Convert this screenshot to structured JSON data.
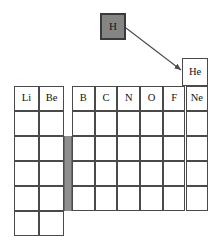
{
  "figure": {
    "type": "periodic-table-fragment",
    "background_color": "#ffffff",
    "cell_border_color": "#4a4a4a",
    "highlight_fill_color": "#858585",
    "highlight_border_color": "#3a3a3a",
    "dblock_bar_color": "#8f8f8f"
  },
  "callout": {
    "label": "H",
    "description": "hydrogen-highlighted-box"
  },
  "connector": {
    "name": "arrow-from-hydrogen-to-helium",
    "color": "#4a4a4a",
    "from": {
      "x": 126,
      "y": 28
    },
    "to": {
      "x": 182,
      "y": 70
    }
  },
  "helium_cell": {
    "label": "He",
    "x": 182,
    "y": 58,
    "w": 26,
    "h": 28
  },
  "s_block": {
    "name": "s-block-left-columns",
    "x": 14,
    "y": 86,
    "cell_w": 25,
    "cell_h": 25,
    "cols": 2,
    "rows": 6,
    "labels": [
      [
        "Li",
        "Be"
      ],
      [
        "",
        ""
      ],
      [
        "",
        ""
      ],
      [
        "",
        ""
      ],
      [
        "",
        ""
      ],
      [
        "",
        ""
      ]
    ]
  },
  "p_block": {
    "name": "p-block-right-columns",
    "x": 72,
    "y": 86,
    "cell_w": 22.7,
    "cell_h": 25,
    "cols": 6,
    "rows": 5,
    "labels": [
      [
        "B",
        "C",
        "N",
        "O",
        "F",
        "Ne"
      ],
      [
        "",
        "",
        "",
        "",
        "",
        ""
      ],
      [
        "",
        "",
        "",
        "",
        "",
        ""
      ],
      [
        "",
        "",
        "",
        "",
        "",
        ""
      ],
      [
        "",
        "",
        "",
        "",
        "",
        ""
      ]
    ]
  },
  "dblock_bar": {
    "name": "d-block-collapsed-spacer",
    "x": 64,
    "y": 136,
    "w": 8,
    "h": 75
  }
}
